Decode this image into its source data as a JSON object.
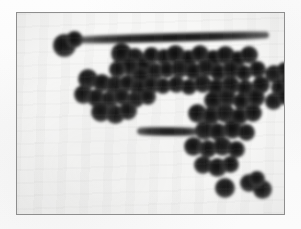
{
  "document": {
    "type": "scanned-figure",
    "caption": "",
    "page_background_color": "#fcfcfc"
  },
  "figure": {
    "name": "particle-cluster-micrograph",
    "frame": {
      "x": 16,
      "y": 12,
      "width": 269,
      "height": 203,
      "border_color": "#8e8e8e",
      "border_width": 1,
      "plate_color": "#f7f7f6"
    },
    "blob_color_dark": "#1d1d1d",
    "blob_color_mid": "#4a4a4a",
    "blob_color_edge": "#8d8d8d",
    "blob_count": 78,
    "streak_count": 2,
    "blobs": [
      {
        "cx": 47,
        "cy": 32,
        "r": 11.5
      },
      {
        "cx": 57,
        "cy": 26,
        "r": 8.5
      },
      {
        "cx": 104,
        "cy": 40,
        "r": 10.5
      },
      {
        "cx": 118,
        "cy": 44,
        "r": 9.0
      },
      {
        "cx": 113,
        "cy": 53,
        "r": 9.5
      },
      {
        "cx": 127,
        "cy": 52,
        "r": 8.0
      },
      {
        "cx": 134,
        "cy": 42,
        "r": 8.5
      },
      {
        "cx": 147,
        "cy": 44,
        "r": 8.0
      },
      {
        "cx": 158,
        "cy": 41,
        "r": 9.5
      },
      {
        "cx": 171,
        "cy": 45,
        "r": 8.5
      },
      {
        "cx": 183,
        "cy": 41,
        "r": 9.0
      },
      {
        "cx": 196,
        "cy": 45,
        "r": 8.5
      },
      {
        "cx": 208,
        "cy": 42,
        "r": 9.5
      },
      {
        "cx": 221,
        "cy": 46,
        "r": 8.0
      },
      {
        "cx": 232,
        "cy": 42,
        "r": 9.0
      },
      {
        "cx": 100,
        "cy": 56,
        "r": 8.5
      },
      {
        "cx": 124,
        "cy": 63,
        "r": 9.0
      },
      {
        "cx": 138,
        "cy": 58,
        "r": 8.5
      },
      {
        "cx": 150,
        "cy": 57,
        "r": 8.0
      },
      {
        "cx": 163,
        "cy": 56,
        "r": 9.0
      },
      {
        "cx": 176,
        "cy": 58,
        "r": 8.5
      },
      {
        "cx": 189,
        "cy": 55,
        "r": 9.0
      },
      {
        "cx": 201,
        "cy": 59,
        "r": 8.5
      },
      {
        "cx": 214,
        "cy": 57,
        "r": 9.0
      },
      {
        "cx": 227,
        "cy": 60,
        "r": 8.0
      },
      {
        "cx": 240,
        "cy": 56,
        "r": 8.5
      },
      {
        "cx": 257,
        "cy": 61,
        "r": 9.0
      },
      {
        "cx": 268,
        "cy": 57,
        "r": 8.0
      },
      {
        "cx": 71,
        "cy": 66,
        "r": 10.0
      },
      {
        "cx": 85,
        "cy": 70,
        "r": 9.0
      },
      {
        "cx": 97,
        "cy": 72,
        "r": 9.5
      },
      {
        "cx": 110,
        "cy": 70,
        "r": 8.5
      },
      {
        "cx": 122,
        "cy": 75,
        "r": 9.0
      },
      {
        "cx": 134,
        "cy": 72,
        "r": 8.5
      },
      {
        "cx": 146,
        "cy": 73,
        "r": 8.0
      },
      {
        "cx": 159,
        "cy": 71,
        "r": 8.5
      },
      {
        "cx": 172,
        "cy": 74,
        "r": 8.0
      },
      {
        "cx": 186,
        "cy": 71,
        "r": 9.0
      },
      {
        "cx": 199,
        "cy": 74,
        "r": 8.5
      },
      {
        "cx": 213,
        "cy": 72,
        "r": 9.5
      },
      {
        "cx": 228,
        "cy": 75,
        "r": 8.5
      },
      {
        "cx": 244,
        "cy": 72,
        "r": 9.0
      },
      {
        "cx": 262,
        "cy": 74,
        "r": 8.5
      },
      {
        "cx": 272,
        "cy": 68,
        "r": 8.0
      },
      {
        "cx": 66,
        "cy": 81,
        "r": 9.5
      },
      {
        "cx": 79,
        "cy": 85,
        "r": 9.0
      },
      {
        "cx": 92,
        "cy": 86,
        "r": 8.5
      },
      {
        "cx": 105,
        "cy": 84,
        "r": 8.0
      },
      {
        "cx": 118,
        "cy": 86,
        "r": 8.5
      },
      {
        "cx": 131,
        "cy": 84,
        "r": 8.0
      },
      {
        "cx": 196,
        "cy": 87,
        "r": 9.5
      },
      {
        "cx": 210,
        "cy": 85,
        "r": 9.0
      },
      {
        "cx": 224,
        "cy": 88,
        "r": 8.5
      },
      {
        "cx": 239,
        "cy": 85,
        "r": 9.0
      },
      {
        "cx": 256,
        "cy": 88,
        "r": 8.5
      },
      {
        "cx": 268,
        "cy": 84,
        "r": 8.0
      },
      {
        "cx": 84,
        "cy": 99,
        "r": 10.0
      },
      {
        "cx": 98,
        "cy": 101,
        "r": 9.5
      },
      {
        "cx": 111,
        "cy": 98,
        "r": 9.0
      },
      {
        "cx": 180,
        "cy": 100,
        "r": 9.5
      },
      {
        "cx": 194,
        "cy": 103,
        "r": 9.0
      },
      {
        "cx": 208,
        "cy": 100,
        "r": 9.5
      },
      {
        "cx": 222,
        "cy": 103,
        "r": 8.5
      },
      {
        "cx": 236,
        "cy": 100,
        "r": 9.0
      },
      {
        "cx": 187,
        "cy": 117,
        "r": 9.5
      },
      {
        "cx": 201,
        "cy": 119,
        "r": 9.0
      },
      {
        "cx": 215,
        "cy": 116,
        "r": 9.5
      },
      {
        "cx": 229,
        "cy": 119,
        "r": 8.5
      },
      {
        "cx": 176,
        "cy": 133,
        "r": 9.5
      },
      {
        "cx": 191,
        "cy": 136,
        "r": 9.0
      },
      {
        "cx": 205,
        "cy": 133,
        "r": 9.5
      },
      {
        "cx": 219,
        "cy": 136,
        "r": 8.5
      },
      {
        "cx": 186,
        "cy": 152,
        "r": 9.0
      },
      {
        "cx": 200,
        "cy": 154,
        "r": 9.5
      },
      {
        "cx": 213,
        "cy": 151,
        "r": 8.5
      },
      {
        "cx": 208,
        "cy": 175,
        "r": 10.0
      },
      {
        "cx": 232,
        "cy": 170,
        "r": 9.0
      },
      {
        "cx": 245,
        "cy": 176,
        "r": 9.5
      },
      {
        "cx": 240,
        "cy": 166,
        "r": 8.0
      }
    ],
    "streaks": [
      {
        "x": 60,
        "y": 20,
        "width": 192,
        "height": 9,
        "rotate": -1.5,
        "name": "upper-long-streak"
      },
      {
        "x": 120,
        "y": 114,
        "width": 62,
        "height": 9,
        "rotate": 0.5,
        "name": "mid-short-streak"
      }
    ]
  }
}
